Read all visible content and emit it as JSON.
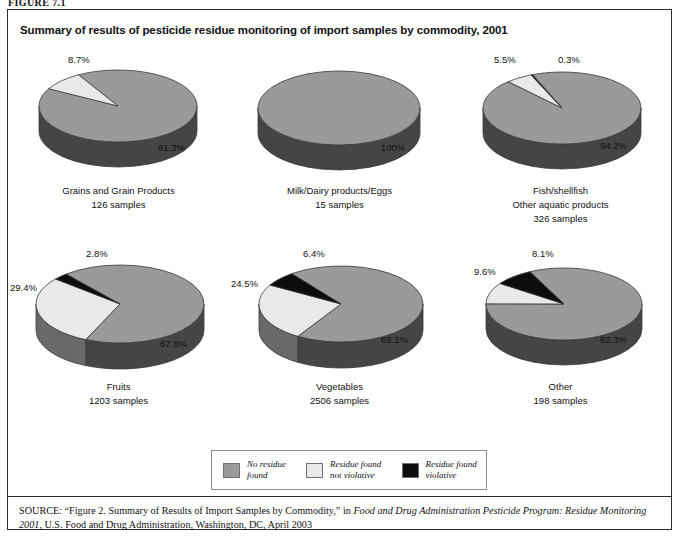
{
  "figure": {
    "number_label": "FIGURE 7.1",
    "title": "Summary of results of pesticide residue monitoring of import samples by commodity, 2001"
  },
  "colors": {
    "no_residue_found": "#9a9a9a",
    "residue_not_violative": "#e9e9e9",
    "residue_violative": "#0d0d0d",
    "pie_side_dark": "#3f3f3f",
    "pie_side_light": "#b4b4b4",
    "outline": "#3a3a3a",
    "border": "#2b2b2b"
  },
  "legend": {
    "items": [
      {
        "swatch": "no_residue_found",
        "line1": "No residue",
        "line2": "found"
      },
      {
        "swatch": "residue_not_violative",
        "line1": "Residue found",
        "line2": "not violative"
      },
      {
        "swatch": "residue_violative",
        "line1": "Residue found",
        "line2": "violative"
      }
    ]
  },
  "source": {
    "prefix": "SOURCE:",
    "text_part1": " “Figure 2. Summary of Results of Import Samples by Commodity,” in ",
    "italic1": "Food and Drug Administration Pesticide Program: Residue Monitoring 2001",
    "text_part2": ", U.S. Food and Drug Administration, Washington, DC, April 2003"
  },
  "chart_data": [
    {
      "type": "pie",
      "title": "Grains and Grain Products",
      "subtitle": "126 samples",
      "samples": 126,
      "categories": [
        "No residue found",
        "Residue found not violative",
        "Residue found violative"
      ],
      "values": [
        91.3,
        8.7,
        0
      ],
      "labels": [
        "91.3%",
        "8.7%",
        ""
      ],
      "legend_position": "bottom-shared"
    },
    {
      "type": "pie",
      "title": "Milk/Dairy products/Eggs",
      "subtitle": "15 samples",
      "samples": 15,
      "categories": [
        "No residue found",
        "Residue found not violative",
        "Residue found violative"
      ],
      "values": [
        100,
        0,
        0
      ],
      "labels": [
        "100%",
        "",
        ""
      ],
      "legend_position": "bottom-shared"
    },
    {
      "type": "pie",
      "title_line1": "Fish/shellfish",
      "title_line2": "Other aquatic products",
      "subtitle": "326 samples",
      "samples": 326,
      "categories": [
        "No residue found",
        "Residue found not violative",
        "Residue found violative"
      ],
      "values": [
        94.2,
        5.5,
        0.3
      ],
      "labels": [
        "94.2%",
        "5.5%",
        "0.3%"
      ],
      "legend_position": "bottom-shared"
    },
    {
      "type": "pie",
      "title": "Fruits",
      "subtitle": "1203 samples",
      "samples": 1203,
      "categories": [
        "No residue found",
        "Residue found not violative",
        "Residue found violative"
      ],
      "values": [
        67.8,
        29.4,
        2.8
      ],
      "labels": [
        "67.8%",
        "29.4%",
        "2.8%"
      ],
      "legend_position": "bottom-shared"
    },
    {
      "type": "pie",
      "title": "Vegetables",
      "subtitle": "2506 samples",
      "samples": 2506,
      "categories": [
        "No residue found",
        "Residue found not violative",
        "Residue found violative"
      ],
      "values": [
        69.1,
        24.5,
        6.4
      ],
      "labels": [
        "69.1%",
        "24.5%",
        "6.4%"
      ],
      "legend_position": "bottom-shared"
    },
    {
      "type": "pie",
      "title": "Other",
      "subtitle": "198 samples",
      "samples": 198,
      "categories": [
        "No residue found",
        "Residue found not violative",
        "Residue found violative"
      ],
      "values": [
        82.3,
        9.6,
        8.1
      ],
      "labels": [
        "82.3%",
        "9.6%",
        "8.1%"
      ],
      "legend_position": "bottom-shared"
    }
  ]
}
